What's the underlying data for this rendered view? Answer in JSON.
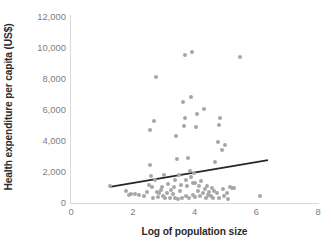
{
  "chart_data": {
    "type": "scatter",
    "title": "",
    "xlabel": "Log of population size",
    "ylabel": "Health expenditure per capita (US$)",
    "xlim": [
      0,
      8
    ],
    "ylim": [
      0,
      12000
    ],
    "xticks": [
      "0",
      "2",
      "4",
      "6",
      "8"
    ],
    "xtick_values": [
      0,
      2,
      4,
      6,
      8
    ],
    "yticks": [
      "0",
      "2,000",
      "4,000",
      "6,000",
      "8,000",
      "10,000",
      "12,000"
    ],
    "ytick_values": [
      0,
      2000,
      4000,
      6000,
      8000,
      10000,
      12000
    ],
    "grid": false,
    "legend": "none",
    "marker_color": "#a6a6a6",
    "trendline_color": "#262626",
    "axis_color": "#d9d9d9",
    "tick_label_color": "#808080",
    "axis_title_color": "#2b2b2b",
    "series": [
      {
        "name": "Countries",
        "points": [
          [
            1.26,
            1090
          ],
          [
            1.78,
            800
          ],
          [
            1.87,
            520
          ],
          [
            1.95,
            560
          ],
          [
            2.07,
            600
          ],
          [
            2.21,
            520
          ],
          [
            2.35,
            430
          ],
          [
            2.45,
            700
          ],
          [
            2.52,
            1180
          ],
          [
            2.55,
            2480
          ],
          [
            2.57,
            4690
          ],
          [
            2.6,
            1760
          ],
          [
            2.63,
            1010
          ],
          [
            2.66,
            330
          ],
          [
            2.7,
            5320
          ],
          [
            2.72,
            1500
          ],
          [
            2.74,
            8140
          ],
          [
            2.78,
            700
          ],
          [
            2.82,
            380
          ],
          [
            2.86,
            620
          ],
          [
            2.9,
            860
          ],
          [
            2.94,
            1040
          ],
          [
            2.98,
            430
          ],
          [
            3.02,
            1780
          ],
          [
            3.06,
            300
          ],
          [
            3.1,
            650
          ],
          [
            3.15,
            1220
          ],
          [
            3.2,
            300
          ],
          [
            3.25,
            840
          ],
          [
            3.3,
            560
          ],
          [
            3.33,
            1050
          ],
          [
            3.36,
            330
          ],
          [
            3.38,
            1490
          ],
          [
            3.41,
            4310
          ],
          [
            3.44,
            2840
          ],
          [
            3.46,
            280
          ],
          [
            3.5,
            1780
          ],
          [
            3.54,
            760
          ],
          [
            3.57,
            1130
          ],
          [
            3.6,
            330
          ],
          [
            3.63,
            6490
          ],
          [
            3.66,
            4970
          ],
          [
            3.68,
            5470
          ],
          [
            3.7,
            9560
          ],
          [
            3.72,
            1490
          ],
          [
            3.74,
            420
          ],
          [
            3.76,
            1110
          ],
          [
            3.79,
            2890
          ],
          [
            3.82,
            300
          ],
          [
            3.85,
            2040
          ],
          [
            3.88,
            1650
          ],
          [
            3.9,
            6830
          ],
          [
            3.92,
            9720
          ],
          [
            3.94,
            1260
          ],
          [
            3.96,
            540
          ],
          [
            3.98,
            1910
          ],
          [
            4.0,
            400
          ],
          [
            4.03,
            1300
          ],
          [
            4.06,
            4930
          ],
          [
            4.09,
            5720
          ],
          [
            4.12,
            770
          ],
          [
            4.15,
            1100
          ],
          [
            4.18,
            420
          ],
          [
            4.22,
            1450
          ],
          [
            4.26,
            640
          ],
          [
            4.3,
            6060
          ],
          [
            4.33,
            900
          ],
          [
            4.36,
            350
          ],
          [
            4.4,
            1070
          ],
          [
            4.44,
            530
          ],
          [
            4.48,
            700
          ],
          [
            4.52,
            420
          ],
          [
            4.56,
            980
          ],
          [
            4.6,
            300
          ],
          [
            4.64,
            760
          ],
          [
            4.68,
            2670
          ],
          [
            4.72,
            640
          ],
          [
            4.76,
            3940
          ],
          [
            4.78,
            5030
          ],
          [
            4.8,
            330
          ],
          [
            4.84,
            5470
          ],
          [
            4.88,
            3400
          ],
          [
            4.92,
            890
          ],
          [
            4.96,
            420
          ],
          [
            5.0,
            3720
          ],
          [
            5.04,
            660
          ],
          [
            5.08,
            280
          ],
          [
            5.14,
            1020
          ],
          [
            5.2,
            960
          ],
          [
            5.28,
            1000
          ],
          [
            5.48,
            9450
          ],
          [
            6.13,
            470
          ]
        ]
      }
    ],
    "trendline": {
      "x0": 1.26,
      "y0": 1040,
      "x1": 6.38,
      "y1": 2770
    }
  }
}
